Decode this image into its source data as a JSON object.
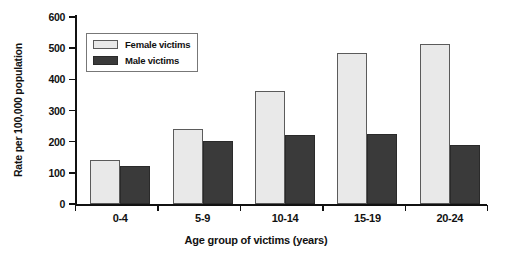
{
  "chart_data": {
    "type": "bar",
    "title": "",
    "xlabel": "Age group of victims (years)",
    "ylabel": "Rate per 100,000 population",
    "categories": [
      "0-4",
      "5-9",
      "10-14",
      "15-19",
      "20-24"
    ],
    "series": [
      {
        "name": "Female victims",
        "values": [
          142,
          242,
          364,
          484,
          512
        ],
        "color": "#e9e9e9"
      },
      {
        "name": "Male victims",
        "values": [
          123,
          203,
          223,
          226,
          190
        ],
        "color": "#3a3a3a"
      }
    ],
    "ylim": [
      0,
      600
    ],
    "yticks": [
      0,
      100,
      200,
      300,
      400,
      500,
      600
    ],
    "ytick_labels": [
      "0",
      "100",
      "200",
      "300",
      "400",
      "500",
      "600"
    ],
    "grid": false,
    "legend_position": "upper-left-inside",
    "legend_entries": [
      "Female victims",
      "Male victims"
    ]
  },
  "axes": {
    "y_title": "Rate per 100,000 population",
    "x_title": "Age group of victims (years)"
  }
}
